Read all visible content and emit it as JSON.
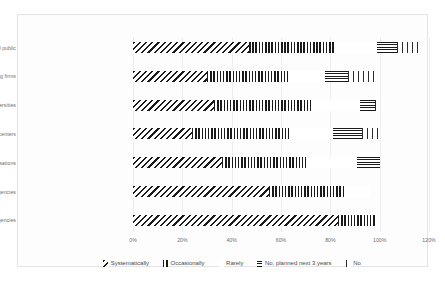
{
  "chart_data": {
    "type": "bar",
    "orientation": "horizontal",
    "stacked": true,
    "title": "",
    "xlabel": "",
    "ylabel": "",
    "xlim": [
      0,
      120
    ],
    "xticks": [
      "0%",
      "20%",
      "40%",
      "60%",
      "80%",
      "100%",
      "120%"
    ],
    "grid": true,
    "legend_position": "bottom",
    "categories": [
      "General public",
      "Consulting firms",
      "Universities",
      "Think tanks/research centers",
      "Int. organisations",
      "Federal ministries or agencies",
      "Dubai govt agencies"
    ],
    "series": [
      {
        "name": "Systematically",
        "pattern": "diagonal-hatch",
        "values": [
          47,
          30,
          33,
          24,
          36,
          55,
          83
        ]
      },
      {
        "name": "Occasionally",
        "pattern": "vertical-lines",
        "values": [
          35,
          33,
          39,
          40,
          34,
          31,
          15
        ]
      },
      {
        "name": "Rarely",
        "pattern": "dotted",
        "values": [
          17,
          15,
          20,
          17,
          21,
          10,
          2
        ]
      },
      {
        "name": "No, planned next 3 years",
        "pattern": "horizontal-lines",
        "values": [
          8,
          9,
          6,
          12,
          9,
          0,
          0
        ]
      },
      {
        "name": "No",
        "pattern": "thin-vertical",
        "values": [
          10,
          11,
          2,
          7,
          0,
          0,
          0
        ]
      }
    ]
  },
  "legend": {
    "items": [
      {
        "label": "Systematically"
      },
      {
        "label": "Occasionally"
      },
      {
        "label": "Rarely"
      },
      {
        "label": "No, planned next 3 years"
      },
      {
        "label": "No"
      }
    ]
  },
  "colors": {
    "ink": "#1a1a1a",
    "label": "#6f6f6f",
    "grid": "#eceff1",
    "card_border": "#e4e4e4",
    "background": "#fdfdfd"
  }
}
